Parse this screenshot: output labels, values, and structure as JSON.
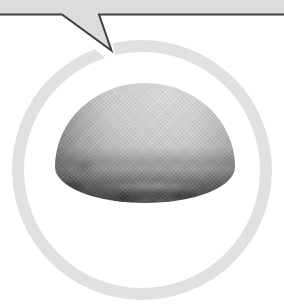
{
  "scene": {
    "background": "#ffffff",
    "description": "callout speech bubble pointing down at a circled grayscale photo of a dome-shaped object"
  },
  "speech_bubble": {
    "fill": "#dcdcdc",
    "outline": "#3f3f3f",
    "halo": "#ffffff"
  },
  "circle_frame": {
    "color": "#e1e1e1",
    "thickness_px": 12
  },
  "dome_photo": {
    "subject": "dome-shaped-object",
    "highlight": "#dfdfdf",
    "midtone": "#a8a8a8",
    "shadow": "#3e3e3e"
  }
}
